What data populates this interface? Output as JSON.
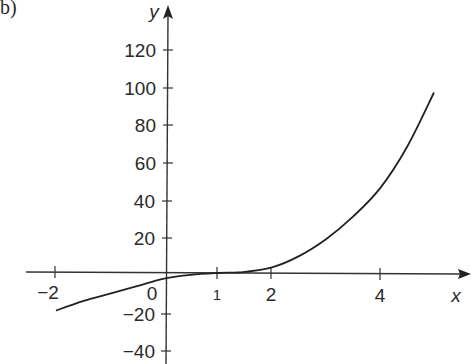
{
  "part_label": "b)",
  "chart_data": {
    "type": "line",
    "title": "",
    "xlabel": "x",
    "ylabel": "y",
    "x_ticks": [
      "-2",
      "0",
      "1",
      "2",
      "4"
    ],
    "y_ticks": [
      "120",
      "100",
      "80",
      "60",
      "40",
      "20",
      "-20",
      "-40"
    ],
    "xlim": [
      -2.5,
      5.6
    ],
    "ylim": [
      -45,
      135
    ],
    "grid": false,
    "legend": null,
    "series": [
      {
        "name": "curve",
        "x": [
          -2,
          -1.5,
          -1,
          -0.5,
          0,
          0.5,
          1,
          1.3,
          1.5,
          2,
          2.5,
          3,
          3.5,
          4,
          4.5,
          5
        ],
        "y": [
          -20,
          -15,
          -11,
          -7,
          -3,
          -1,
          0,
          0.2,
          0.6,
          3,
          9,
          18,
          30,
          45,
          67,
          96
        ]
      }
    ]
  },
  "axis_labels": {
    "x": "x",
    "y": "y",
    "origin": "0",
    "xticks": {
      "m2": "−2",
      "one": "1",
      "two": "2",
      "four": "4"
    },
    "yticks": {
      "p120": "120",
      "p100": "100",
      "p80": "80",
      "p60": "60",
      "p40": "40",
      "p20": "20",
      "m20": "−20",
      "m40": "−40"
    }
  }
}
